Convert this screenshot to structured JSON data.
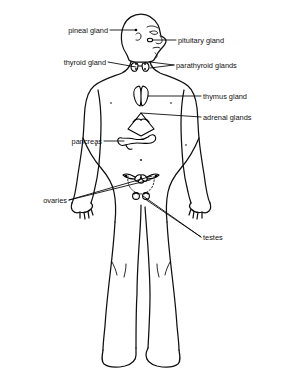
{
  "diagram": {
    "background_color": "#ffffff",
    "line_color": "#101010",
    "text_color": "#111111"
  },
  "labels": {
    "pineal": "pineal gland",
    "pituitary": "pituitary gland",
    "thyroid": "thyroid gland",
    "parathyroid": "parathyroid glands",
    "thymus": "thymus gland",
    "adrenal": "adrenal glands",
    "pancreas": "pancreas",
    "ovaries": "ovaries",
    "testes": "testes"
  },
  "callouts": [
    {
      "id": "pineal",
      "text": "pineal gland",
      "side": "left",
      "text_x": 108,
      "text_y": 33,
      "target_x": 136,
      "target_y": 30
    },
    {
      "id": "pituitary",
      "text": "pituitary gland",
      "side": "right",
      "text_x": 178,
      "text_y": 43,
      "target_x": 150,
      "target_y": 40
    },
    {
      "id": "thyroid",
      "text": "thyroid gland",
      "side": "left",
      "text_x": 106,
      "text_y": 65,
      "target_x": 136,
      "target_y": 68
    },
    {
      "id": "parathyroid",
      "text": "parathyroid glands",
      "side": "right",
      "text_x": 176,
      "text_y": 68,
      "target_x": 148,
      "target_y": 66
    },
    {
      "id": "thymus",
      "text": "thymus gland",
      "side": "right",
      "text_x": 203,
      "text_y": 99,
      "target_x": 145,
      "target_y": 96
    },
    {
      "id": "adrenal",
      "text": "adrenal glands",
      "side": "right",
      "text_x": 203,
      "text_y": 120,
      "target_x": 141,
      "target_y": 113
    },
    {
      "id": "pancreas",
      "text": "pancreas",
      "side": "left",
      "text_x": 73,
      "text_y": 144,
      "target_x": 126,
      "target_y": 140
    },
    {
      "id": "ovaries",
      "text": "ovaries",
      "side": "left",
      "text_x": 46,
      "text_y": 203,
      "target_x": 150,
      "target_y": 177
    },
    {
      "id": "testes",
      "text": "testes",
      "side": "right",
      "text_x": 203,
      "text_y": 240,
      "target_x": 139,
      "target_y": 196
    }
  ],
  "organs": [
    {
      "id": "pineal-gland",
      "name": "pineal gland",
      "x": 136,
      "y": 30,
      "shape": "dot"
    },
    {
      "id": "pituitary-gland",
      "name": "pituitary gland",
      "x": 150,
      "y": 40,
      "shape": "small-oval"
    },
    {
      "id": "thyroid-gland",
      "name": "thyroid gland",
      "x": 140,
      "y": 66,
      "shape": "butterfly"
    },
    {
      "id": "parathyroid-glands",
      "name": "parathyroid glands",
      "x": 146,
      "y": 65,
      "shape": "paired-dots"
    },
    {
      "id": "thymus-gland",
      "name": "thymus gland",
      "x": 142,
      "y": 96,
      "shape": "lobed-bilobed"
    },
    {
      "id": "adrenal-glands",
      "name": "adrenal glands",
      "x": 141,
      "y": 118,
      "shape": "kidney-cap-triangle"
    },
    {
      "id": "pancreas",
      "name": "pancreas",
      "x": 137,
      "y": 141,
      "shape": "tadpole"
    },
    {
      "id": "ovaries",
      "name": "ovaries",
      "x": 142,
      "y": 177,
      "shape": "uterus-with-ovaries"
    },
    {
      "id": "testes",
      "name": "testes",
      "x": 140,
      "y": 196,
      "shape": "paired-circles"
    }
  ]
}
